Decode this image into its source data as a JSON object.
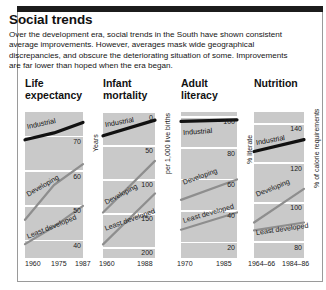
{
  "credit": "Human Development Report 1990, Oxford University Press/UNDP",
  "headline": "Social trends",
  "blurb": "Over the development era, social trends in the South have shown consistent average improvements. However, averages mask wide geographical discrepancies, and obscure the deteriorating situation of some. Improvements are far lower than hoped when the era began.",
  "colors": {
    "plot_background": "#c9c9c9",
    "gridline": "#ffffff",
    "industrial": "#111111",
    "developing": "#8e8e8e",
    "least_developed": "#8e8e8e",
    "panel_border": "#9a9a9a",
    "topbar": "#1c1c1c",
    "text": "#141414"
  },
  "chart_data": [
    {
      "type": "line",
      "title": "Life\nexpectancy",
      "ylabel": "Years",
      "xlabel": "",
      "x": [
        "1960",
        "1975",
        "1987"
      ],
      "yticks": [
        70,
        60,
        50,
        40
      ],
      "ylim": [
        35,
        77
      ],
      "grid": true,
      "series": [
        {
          "name": "Industrial",
          "values": [
            69,
            71,
            74
          ]
        },
        {
          "name": "Developing",
          "values": [
            46,
            56,
            62
          ]
        },
        {
          "name": "Least developed",
          "values": [
            39,
            44,
            50
          ]
        }
      ]
    },
    {
      "type": "line",
      "title": "Infant\nmortality",
      "ylabel": "per 1,000 live births",
      "xlabel": "",
      "x": [
        "1960",
        "1988"
      ],
      "yticks": [
        0,
        50,
        100,
        150,
        200
      ],
      "ylim": [
        0,
        215
      ],
      "grid": true,
      "series": [
        {
          "name": "Industrial",
          "values": [
            35,
            12
          ]
        },
        {
          "name": "Developing",
          "values": [
            148,
            72
          ]
        },
        {
          "name": "Least developed",
          "values": [
            195,
            120
          ]
        }
      ]
    },
    {
      "type": "line",
      "title": "Adult\nliteracy",
      "ylabel": "% literate",
      "xlabel": "",
      "x": [
        "1970",
        "1985"
      ],
      "yticks": [
        100,
        80,
        60,
        40,
        20
      ],
      "ylim": [
        10,
        103
      ],
      "grid": true,
      "series": [
        {
          "name": "Industrial",
          "values": [
            97,
            98
          ]
        },
        {
          "name": "Developing",
          "values": [
            47,
            60
          ]
        },
        {
          "name": "Least developed",
          "values": [
            28,
            39
          ]
        }
      ]
    },
    {
      "type": "line",
      "title": "Nutrition",
      "ylabel": "% of calorie requirements",
      "xlabel": "",
      "x": [
        "1964–66",
        "1984–86"
      ],
      "yticks": [
        140,
        120,
        100,
        80
      ],
      "ylim": [
        72,
        146
      ],
      "grid": true,
      "series": [
        {
          "name": "Industrial",
          "values": [
            126,
            132
          ]
        },
        {
          "name": "Developing",
          "values": [
            90,
            107
          ]
        },
        {
          "name": "Least developed",
          "values": [
            86,
            90
          ]
        }
      ]
    }
  ]
}
